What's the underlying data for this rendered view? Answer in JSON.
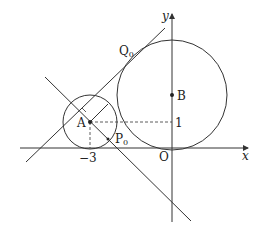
{
  "diagram": {
    "type": "coordinate-geometry",
    "labels": {
      "x_axis": "x",
      "y_axis": "y",
      "origin": "O",
      "point_a": "A",
      "point_b": "B",
      "point_p": "P",
      "point_p_sub": "0",
      "point_q": "Q",
      "point_q_sub": "0",
      "tick_x": "−3",
      "tick_y": "1"
    },
    "points": {
      "A": [
        -3,
        1
      ],
      "B": [
        0,
        "above 1"
      ],
      "O": [
        0,
        0
      ]
    },
    "elements": [
      "circle centered at A(-3,1) tangent to x-axis",
      "circle centered at B on y-axis tangent to x-axis at O",
      "common tangent line touching big circle at Q0",
      "line through A perpendicular to tangent, meeting small circle at P0",
      "dashed lines from A to x-axis and y-axis",
      "right-angle marker at foot of perpendicular"
    ],
    "colors": {
      "stroke": "#333333",
      "background": "#ffffff"
    }
  }
}
